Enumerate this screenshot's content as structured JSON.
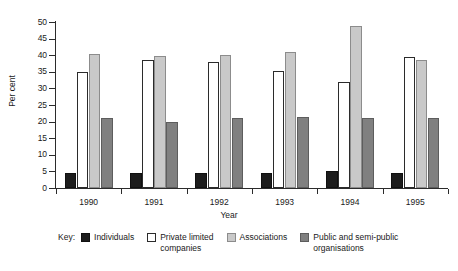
{
  "chart_data": {
    "type": "bar",
    "title": "",
    "xlabel": "Year",
    "ylabel": "Per cent",
    "categories": [
      "1990",
      "1991",
      "1992",
      "1993",
      "1994",
      "1995"
    ],
    "ylim": [
      0,
      50
    ],
    "yticks": [
      0,
      5,
      10,
      15,
      20,
      25,
      30,
      35,
      40,
      45,
      50
    ],
    "grid": false,
    "legend_position": "bottom",
    "legend_prefix": "Key:",
    "series": [
      {
        "name": "Individuals",
        "color": "#1c1c1c",
        "values": [
          4.5,
          4.5,
          4.5,
          4.5,
          5.0,
          4.5
        ]
      },
      {
        "name": "Private limited\ncompanies",
        "color": "#ffffff",
        "values": [
          35.0,
          38.5,
          38.0,
          35.3,
          31.8,
          39.5
        ]
      },
      {
        "name": "Associations",
        "color": "#c9c9c9",
        "values": [
          40.5,
          39.8,
          40.0,
          41.0,
          48.8,
          38.5
        ]
      },
      {
        "name": "Public and semi-public\norganisations",
        "color": "#808080",
        "values": [
          21.0,
          20.0,
          21.0,
          21.5,
          21.0,
          21.0
        ]
      }
    ]
  },
  "legend": {
    "key_label": "Key:",
    "items": [
      {
        "label": "Individuals",
        "swatch": "individuals"
      },
      {
        "label": "Private limited\ncompanies",
        "swatch": "private"
      },
      {
        "label": "Associations",
        "swatch": "associations"
      },
      {
        "label": "Public and semi-public\norganisations",
        "swatch": "public"
      }
    ]
  }
}
